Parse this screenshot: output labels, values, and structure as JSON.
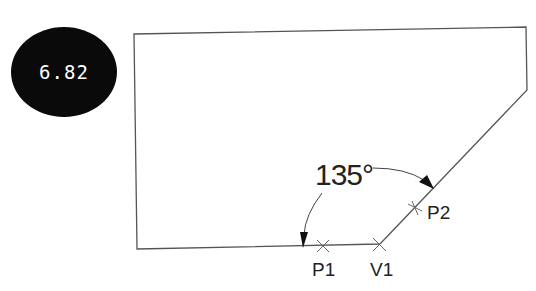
{
  "badge": {
    "value": "6.82",
    "color": "#0a0a0a",
    "text_color": "#ffffff"
  },
  "diagram": {
    "angle_label": "135°",
    "points": {
      "p1": "P1",
      "v1": "V1",
      "p2": "P2"
    },
    "line_color": "#555555"
  }
}
